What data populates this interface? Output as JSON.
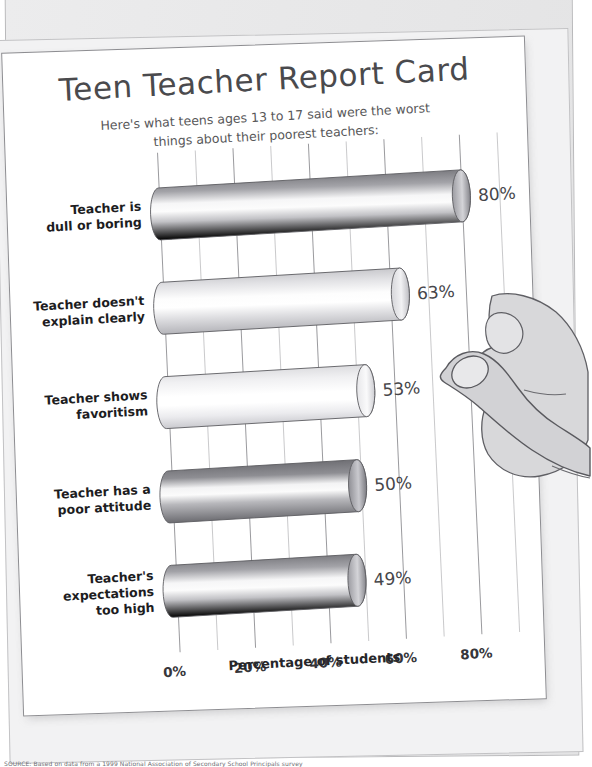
{
  "poster": {
    "title": "Teen Teacher Report Card",
    "subtitle_line1": "Here's what teens ages 13 to 17 said were the worst",
    "subtitle_line2": "things about their poorest teachers:",
    "source_note": "SOURCE: Based on data from a 1999 National Association of Secondary School Principals survey"
  },
  "chart_data": {
    "type": "bar",
    "orientation": "horizontal",
    "title": "Teen Teacher Report Card",
    "subtitle": "Here's what teens ages 13 to 17 said were the worst things about their poorest teachers:",
    "xlabel": "Percentage of students",
    "ylabel": "",
    "xlim": [
      0,
      90
    ],
    "xticks": [
      0,
      20,
      40,
      60,
      80
    ],
    "xtick_labels": [
      "0%",
      "20%",
      "40%",
      "60%",
      "80%"
    ],
    "gridline_step": 10,
    "grid": true,
    "legend": "none",
    "categories": [
      "Teacher is dull or boring",
      "Teacher doesn't explain clearly",
      "Teacher shows favoritism",
      "Teacher has a poor attitude",
      "Teacher's expectations too high"
    ],
    "values": [
      80,
      63,
      53,
      50,
      49
    ],
    "value_labels": [
      "80%",
      "63%",
      "53%",
      "50%",
      "49%"
    ],
    "bars": [
      {
        "label_line1": "Teacher is",
        "label_line2": "dull or boring",
        "label_line3": "",
        "value": 80,
        "value_label": "80%",
        "shade": "dark"
      },
      {
        "label_line1": "Teacher doesn't",
        "label_line2": "explain clearly",
        "label_line3": "",
        "value": 63,
        "value_label": "63%",
        "shade": "light"
      },
      {
        "label_line1": "Teacher shows",
        "label_line2": "favoritism",
        "label_line3": "",
        "value": 53,
        "value_label": "53%",
        "shade": "lightest"
      },
      {
        "label_line1": "Teacher has a",
        "label_line2": "poor attitude",
        "label_line3": "",
        "value": 50,
        "value_label": "50%",
        "shade": "darkest"
      },
      {
        "label_line1": "Teacher's",
        "label_line2": "expectations",
        "label_line3": "too high",
        "value": 49,
        "value_label": "49%",
        "shade": "dark"
      }
    ]
  },
  "colors": {
    "paper": "#ffffff",
    "backing": "#e9e9ea",
    "title_text": "#4a4a4d",
    "body_text": "#1d1d1f",
    "value_text": "#46464a",
    "gridline": "#8a8a8e",
    "bar_dark": "#7b7b80",
    "bar_light": "#e6e6e8",
    "hand_fill": "#d6d6d8",
    "hand_outline": "#5c5c60"
  }
}
